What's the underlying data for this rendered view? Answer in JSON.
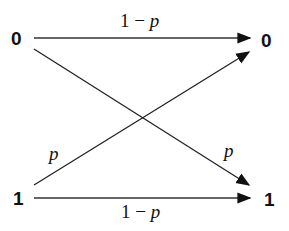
{
  "diagram": {
    "type": "binary-symmetric-channel",
    "inputs": [
      {
        "label": "0",
        "x": 18,
        "y": 38
      },
      {
        "label": "1",
        "x": 20,
        "y": 198
      }
    ],
    "outputs": [
      {
        "label": "0",
        "x": 268,
        "y": 40
      },
      {
        "label": "1",
        "x": 270,
        "y": 199
      }
    ],
    "edges": [
      {
        "from": "0",
        "to": "0",
        "label": {
          "prefix": "1 − ",
          "var": "p"
        }
      },
      {
        "from": "0",
        "to": "1",
        "label": {
          "prefix": "",
          "var": "p"
        }
      },
      {
        "from": "1",
        "to": "0",
        "label": {
          "prefix": "",
          "var": "p"
        }
      },
      {
        "from": "1",
        "to": "1",
        "label": {
          "prefix": "1 − ",
          "var": "p"
        }
      }
    ],
    "colors": {
      "stroke": "#222222",
      "text": "#111111",
      "background": "#ffffff"
    }
  }
}
